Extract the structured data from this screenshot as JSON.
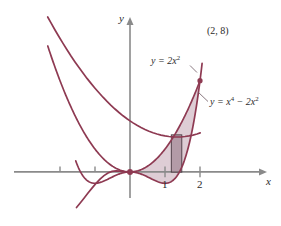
{
  "figure": {
    "background": "#ffffff",
    "curve_color": "#8e3a52",
    "axis_color": "#8a8a8a",
    "fill_color": "#c9aebb",
    "rect_fill": "#a88f9b",
    "text_color": "#2b2b2b"
  },
  "axes": {
    "x_label": "x",
    "y_label": "y",
    "x_ticks": [
      {
        "value": -2,
        "label": ""
      },
      {
        "value": -1,
        "label": ""
      },
      {
        "value": 1,
        "label": "1"
      },
      {
        "value": 2,
        "label": "2"
      }
    ]
  },
  "curves": [
    {
      "id": "parabola",
      "label_prefix": "y = 2x",
      "label_exp": "2",
      "expression": "y = 2x^2"
    },
    {
      "id": "quartic",
      "label_prefix": "y = x",
      "label_exp1": "4",
      "label_mid": " − 2x",
      "label_exp2": "2",
      "expression": "y = x^4 - 2x^2"
    }
  ],
  "annotations": {
    "intersection_point": "(2, 8)"
  },
  "chart_data": {
    "type": "line",
    "title": "",
    "xlabel": "x",
    "ylabel": "y",
    "xlim": [
      -2.6,
      2.6
    ],
    "ylim": [
      -1.6,
      9.2
    ],
    "grid": false,
    "legend": "inline-curve-labels",
    "series": [
      {
        "name": "y = 2x^2",
        "formula": "2*x^2",
        "x_range": [
          -2.35,
          2.0
        ]
      },
      {
        "name": "y = x^4 - 2x^2",
        "formula": "x^4 - 2*x^2",
        "x_range": [
          -1.55,
          2.06
        ]
      }
    ],
    "shaded_region": {
      "between": [
        "y = 2x^2",
        "y = x^4 - 2x^2"
      ],
      "x_from": 0,
      "x_to": 2
    },
    "representative_rectangle": {
      "x_left": 1.18,
      "x_right": 1.48,
      "y_bottom": -0.02,
      "y_top": 3.25
    },
    "marked_points": [
      {
        "label": "(2, 8)",
        "x": 2,
        "y": 8
      }
    ]
  }
}
